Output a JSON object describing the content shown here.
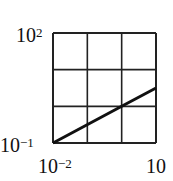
{
  "chart_data": {
    "type": "line",
    "title": "",
    "xlabel": "",
    "ylabel": "",
    "xscale": "log",
    "yscale": "log",
    "xlim": [
      0.01,
      10
    ],
    "ylim": [
      0.1,
      100
    ],
    "grid": true,
    "x_tick_labels": [
      "10^-2",
      "10"
    ],
    "y_tick_labels": [
      "10^2",
      "10^-1"
    ],
    "series": [
      {
        "name": "line",
        "x": [
          0.01,
          1,
          10
        ],
        "y": [
          0.1,
          1,
          3.16
        ]
      }
    ],
    "legend": null
  },
  "labels": {
    "y_top": {
      "base": "10",
      "exp": "2"
    },
    "y_bottom": {
      "base": "10",
      "exp": "−1"
    },
    "x_left": {
      "base": "10",
      "exp": "−2"
    },
    "x_right": {
      "base": "10",
      "exp": ""
    }
  },
  "colors": {
    "line": "#111111",
    "grid": "#222222",
    "background": "#ffffff"
  }
}
